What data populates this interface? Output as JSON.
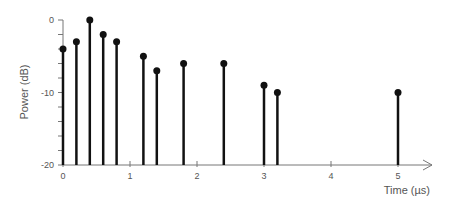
{
  "chart_data": {
    "type": "stem",
    "title": "",
    "xlabel": "Time (µs)",
    "ylabel": "Power (dB)",
    "x": [
      0,
      0.2,
      0.4,
      0.6,
      0.8,
      1.2,
      1.4,
      1.8,
      2.4,
      3.0,
      3.2,
      5.0
    ],
    "values": [
      -4,
      -3,
      0,
      -2,
      -3,
      -5,
      -7,
      -6,
      -6,
      -9,
      -10,
      -10
    ],
    "xlim": [
      0,
      5.5
    ],
    "ylim": [
      -20,
      0
    ],
    "x_ticks": [
      "0",
      "1",
      "2",
      "3",
      "4",
      "5"
    ],
    "y_ticks": [
      "0",
      "-10",
      "-20"
    ],
    "y_minor_step": 2,
    "grid": false,
    "legend": null,
    "colors": {
      "stem": "#111111",
      "axis": "#777777",
      "text": "#555555"
    }
  }
}
